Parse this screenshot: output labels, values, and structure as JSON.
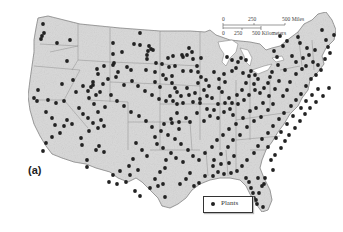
{
  "map": {
    "panel_label": "(a)",
    "scale": {
      "miles_ticks": [
        "0",
        "250",
        "500 Miles"
      ],
      "km_ticks": [
        "0",
        "250",
        "500 Kilometers"
      ]
    },
    "legend": {
      "items": [
        {
          "symbol": "dot",
          "label": "Plants",
          "color": "#222222"
        }
      ]
    },
    "colors": {
      "land": "#d9d9d9",
      "border": "#8a8a8a",
      "dot": "#222222"
    },
    "points": [
      [
        43,
        24
      ],
      [
        44,
        33
      ],
      [
        42,
        36
      ],
      [
        41,
        39
      ],
      [
        57,
        43
      ],
      [
        70,
        40
      ],
      [
        67,
        61
      ],
      [
        113,
        43
      ],
      [
        134,
        44
      ],
      [
        149,
        46
      ],
      [
        151,
        49
      ],
      [
        153,
        50
      ],
      [
        148,
        51
      ],
      [
        113,
        54
      ],
      [
        122,
        52
      ],
      [
        113,
        65
      ],
      [
        127,
        67
      ],
      [
        131,
        70
      ],
      [
        118,
        72
      ],
      [
        140,
        33
      ],
      [
        140,
        45
      ],
      [
        147,
        55
      ],
      [
        147,
        59
      ],
      [
        146,
        70
      ],
      [
        155,
        72
      ],
      [
        155,
        82
      ],
      [
        163,
        75
      ],
      [
        166,
        79
      ],
      [
        172,
        83
      ],
      [
        177,
        92
      ],
      [
        169,
        67
      ],
      [
        175,
        88
      ],
      [
        172,
        76
      ],
      [
        173,
        56
      ],
      [
        183,
        57
      ],
      [
        182,
        55
      ],
      [
        187,
        55
      ],
      [
        192,
        52
      ],
      [
        189,
        48
      ],
      [
        193,
        59
      ],
      [
        183,
        71
      ],
      [
        191,
        71
      ],
      [
        201,
        58
      ],
      [
        197,
        66
      ],
      [
        198,
        72
      ],
      [
        201,
        77
      ],
      [
        198,
        83
      ],
      [
        206,
        80
      ],
      [
        204,
        90
      ],
      [
        207,
        96
      ],
      [
        212,
        98
      ],
      [
        209,
        86
      ],
      [
        219,
        88
      ],
      [
        222,
        92
      ],
      [
        219,
        79
      ],
      [
        214,
        72
      ],
      [
        225,
        82
      ],
      [
        224,
        74
      ],
      [
        232,
        71
      ],
      [
        236,
        68
      ],
      [
        238,
        62
      ],
      [
        232,
        60
      ],
      [
        227,
        57
      ],
      [
        241,
        58
      ],
      [
        246,
        60
      ],
      [
        243,
        73
      ],
      [
        249,
        76
      ],
      [
        251,
        71
      ],
      [
        255,
        75
      ],
      [
        258,
        79
      ],
      [
        254,
        84
      ],
      [
        246,
        83
      ],
      [
        242,
        90
      ],
      [
        237,
        95
      ],
      [
        229,
        98
      ],
      [
        232,
        103
      ],
      [
        225,
        103
      ],
      [
        218,
        104
      ],
      [
        214,
        110
      ],
      [
        207,
        109
      ],
      [
        200,
        103
      ],
      [
        193,
        102
      ],
      [
        189,
        95
      ],
      [
        183,
        103
      ],
      [
        187,
        88
      ],
      [
        195,
        93
      ],
      [
        200,
        99
      ],
      [
        181,
        96
      ],
      [
        177,
        104
      ],
      [
        173,
        101
      ],
      [
        166,
        101
      ],
      [
        170,
        96
      ],
      [
        177,
        113
      ],
      [
        171,
        119
      ],
      [
        164,
        124
      ],
      [
        172,
        123
      ],
      [
        179,
        122
      ],
      [
        179,
        129
      ],
      [
        186,
        118
      ],
      [
        190,
        122
      ],
      [
        197,
        113
      ],
      [
        204,
        121
      ],
      [
        210,
        116
      ],
      [
        218,
        118
      ],
      [
        224,
        112
      ],
      [
        230,
        109
      ],
      [
        233,
        115
      ],
      [
        238,
        104
      ],
      [
        244,
        100
      ],
      [
        249,
        95
      ],
      [
        255,
        90
      ],
      [
        260,
        93
      ],
      [
        264,
        88
      ],
      [
        268,
        83
      ],
      [
        270,
        77
      ],
      [
        272,
        72
      ],
      [
        278,
        65
      ],
      [
        277,
        57
      ],
      [
        274,
        51
      ],
      [
        283,
        46
      ],
      [
        287,
        41
      ],
      [
        280,
        36
      ],
      [
        298,
        37
      ],
      [
        300,
        43
      ],
      [
        292,
        56
      ],
      [
        296,
        62
      ],
      [
        285,
        70
      ],
      [
        279,
        81
      ],
      [
        275,
        89
      ],
      [
        269,
        96
      ],
      [
        263,
        103
      ],
      [
        256,
        108
      ],
      [
        250,
        111
      ],
      [
        243,
        118
      ],
      [
        236,
        124
      ],
      [
        229,
        129
      ],
      [
        223,
        135
      ],
      [
        217,
        140
      ],
      [
        212,
        147
      ],
      [
        205,
        153
      ],
      [
        214,
        160
      ],
      [
        221,
        154
      ],
      [
        228,
        147
      ],
      [
        233,
        140
      ],
      [
        240,
        135
      ],
      [
        247,
        127
      ],
      [
        254,
        121
      ],
      [
        261,
        117
      ],
      [
        268,
        110
      ],
      [
        273,
        104
      ],
      [
        283,
        96
      ],
      [
        287,
        90
      ],
      [
        290,
        82
      ],
      [
        296,
        74
      ],
      [
        302,
        69
      ],
      [
        306,
        66
      ],
      [
        303,
        58
      ],
      [
        309,
        55
      ],
      [
        315,
        50
      ],
      [
        307,
        48
      ],
      [
        313,
        62
      ],
      [
        318,
        65
      ],
      [
        321,
        70
      ],
      [
        316,
        75
      ],
      [
        311,
        79
      ],
      [
        306,
        86
      ],
      [
        301,
        94
      ],
      [
        296,
        100
      ],
      [
        291,
        106
      ],
      [
        284,
        113
      ],
      [
        279,
        119
      ],
      [
        273,
        126
      ],
      [
        268,
        133
      ],
      [
        262,
        139
      ],
      [
        258,
        146
      ],
      [
        254,
        153
      ],
      [
        247,
        160
      ],
      [
        242,
        166
      ],
      [
        237,
        171
      ],
      [
        231,
        173
      ],
      [
        224,
        174
      ],
      [
        218,
        172
      ],
      [
        213,
        176
      ],
      [
        205,
        176
      ],
      [
        199,
        183
      ],
      [
        194,
        186
      ],
      [
        190,
        173
      ],
      [
        186,
        179
      ],
      [
        180,
        184
      ],
      [
        183,
        162
      ],
      [
        176,
        158
      ],
      [
        171,
        153
      ],
      [
        166,
        160
      ],
      [
        163,
        148
      ],
      [
        157,
        144
      ],
      [
        155,
        137
      ],
      [
        147,
        156
      ],
      [
        142,
        150
      ],
      [
        136,
        143
      ],
      [
        133,
        159
      ],
      [
        129,
        166
      ],
      [
        120,
        171
      ],
      [
        113,
        175
      ],
      [
        109,
        182
      ],
      [
        117,
        184
      ],
      [
        126,
        182
      ],
      [
        130,
        175
      ],
      [
        138,
        170
      ],
      [
        150,
        188
      ],
      [
        155,
        179
      ],
      [
        160,
        172
      ],
      [
        165,
        168
      ],
      [
        163,
        184
      ],
      [
        158,
        186
      ],
      [
        165,
        197
      ],
      [
        140,
        196
      ],
      [
        135,
        191
      ],
      [
        96,
        150
      ],
      [
        99,
        146
      ],
      [
        104,
        152
      ],
      [
        87,
        160
      ],
      [
        87,
        167
      ],
      [
        82,
        145
      ],
      [
        81,
        138
      ],
      [
        104,
        126
      ],
      [
        98,
        112
      ],
      [
        94,
        104
      ],
      [
        89,
        98
      ],
      [
        88,
        91
      ],
      [
        91,
        87
      ],
      [
        93,
        85
      ],
      [
        96,
        95
      ],
      [
        100,
        92
      ],
      [
        103,
        84
      ],
      [
        108,
        79
      ],
      [
        93,
        82
      ],
      [
        98,
        74
      ],
      [
        97,
        69
      ],
      [
        104,
        66
      ],
      [
        114,
        63
      ],
      [
        116,
        77
      ],
      [
        105,
        107
      ],
      [
        101,
        120
      ],
      [
        89,
        131
      ],
      [
        72,
        124
      ],
      [
        67,
        120
      ],
      [
        46,
        112
      ],
      [
        52,
        118
      ],
      [
        37,
        101
      ],
      [
        34,
        98
      ],
      [
        38,
        90
      ],
      [
        48,
        100
      ],
      [
        56,
        103
      ],
      [
        62,
        84
      ],
      [
        73,
        80
      ],
      [
        76,
        92
      ],
      [
        83,
        86
      ],
      [
        64,
        126
      ],
      [
        60,
        133
      ],
      [
        52,
        137
      ],
      [
        46,
        143
      ],
      [
        43,
        151
      ],
      [
        55,
        125
      ],
      [
        64,
        101
      ],
      [
        79,
        108
      ],
      [
        83,
        114
      ],
      [
        88,
        118
      ],
      [
        93,
        123
      ],
      [
        98,
        128
      ],
      [
        246,
        178
      ],
      [
        249,
        182
      ],
      [
        251,
        188
      ],
      [
        253,
        193
      ],
      [
        254,
        198
      ],
      [
        256,
        200
      ],
      [
        257,
        204
      ],
      [
        263,
        207
      ],
      [
        259,
        193
      ],
      [
        262,
        186
      ],
      [
        264,
        184
      ],
      [
        258,
        178
      ],
      [
        265,
        178
      ],
      [
        273,
        170
      ],
      [
        271,
        160
      ],
      [
        275,
        155
      ],
      [
        281,
        148
      ],
      [
        285,
        141
      ],
      [
        289,
        135
      ],
      [
        295,
        128
      ],
      [
        300,
        121
      ],
      [
        305,
        114
      ],
      [
        310,
        108
      ],
      [
        316,
        102
      ],
      [
        323,
        96
      ],
      [
        329,
        88
      ],
      [
        318,
        89
      ],
      [
        312,
        95
      ],
      [
        306,
        101
      ],
      [
        301,
        108
      ],
      [
        293,
        116
      ],
      [
        287,
        124
      ],
      [
        281,
        132
      ],
      [
        276,
        138
      ],
      [
        268,
        147
      ],
      [
        234,
        156
      ],
      [
        229,
        163
      ],
      [
        221,
        164
      ],
      [
        213,
        166
      ],
      [
        199,
        160
      ],
      [
        193,
        156
      ],
      [
        188,
        150
      ],
      [
        181,
        144
      ],
      [
        175,
        139
      ],
      [
        168,
        135
      ],
      [
        161,
        131
      ],
      [
        152,
        127
      ],
      [
        146,
        121
      ],
      [
        139,
        116
      ],
      [
        131,
        112
      ],
      [
        124,
        106
      ],
      [
        117,
        101
      ],
      [
        111,
        95
      ],
      [
        124,
        85
      ],
      [
        132,
        81
      ],
      [
        138,
        86
      ],
      [
        145,
        91
      ],
      [
        152,
        95
      ],
      [
        159,
        99
      ],
      [
        160,
        87
      ],
      [
        156,
        63
      ],
      [
        162,
        64
      ],
      [
        168,
        58
      ],
      [
        175,
        66
      ],
      [
        326,
        40
      ],
      [
        328,
        47
      ],
      [
        330,
        53
      ],
      [
        325,
        59
      ],
      [
        322,
        30
      ],
      [
        334,
        35
      ]
    ]
  }
}
